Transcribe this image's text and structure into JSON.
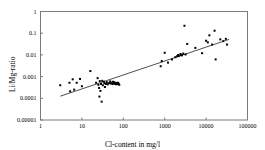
{
  "chart_data": {
    "type": "scatter",
    "title": "",
    "xlabel": "Cl-content in mg/l",
    "ylabel": "Li/Mg-ratio",
    "xscale": "log",
    "yscale": "log",
    "xlim": [
      1,
      100000
    ],
    "ylim": [
      1e-05,
      1
    ],
    "xticks": [
      1,
      10,
      100,
      1000,
      10000,
      100000
    ],
    "xtick_labels": [
      "1",
      "10",
      "100",
      "1000",
      "10000",
      "100000"
    ],
    "yticks": [
      1e-05,
      0.0001,
      0.001,
      0.01,
      0.1,
      1
    ],
    "ytick_labels": [
      "0.00001",
      "0.0001",
      "0.001",
      "0.01",
      "0.1",
      "1"
    ],
    "grid": false,
    "legend": "none",
    "marker": "square",
    "marker_color": "#000000",
    "marker_size": 2,
    "series": [
      {
        "name": "samples",
        "points": [
          [
            3.0,
            0.0004
          ],
          [
            5.0,
            0.00052
          ],
          [
            5.2,
            0.00021
          ],
          [
            6.0,
            0.00075
          ],
          [
            6.5,
            0.00025
          ],
          [
            7.5,
            0.00052
          ],
          [
            9.0,
            0.00078
          ],
          [
            10.0,
            0.00036
          ],
          [
            16.0,
            0.0018
          ],
          [
            22.0,
            0.00052
          ],
          [
            24.0,
            0.00085
          ],
          [
            25.0,
            0.00042
          ],
          [
            26.0,
            0.0003
          ],
          [
            26.5,
            0.00012
          ],
          [
            27.0,
            0.00062
          ],
          [
            28.0,
            0.00022
          ],
          [
            29.0,
            0.00046
          ],
          [
            30.0,
            7e-05
          ],
          [
            31.0,
            0.00064
          ],
          [
            32.0,
            0.0004
          ],
          [
            34.0,
            0.00058
          ],
          [
            35.0,
            0.0005
          ],
          [
            36.0,
            0.00033
          ],
          [
            38.0,
            0.00046
          ],
          [
            40.0,
            0.00055
          ],
          [
            42.0,
            0.00044
          ],
          [
            45.0,
            0.0005
          ],
          [
            48.0,
            0.0006
          ],
          [
            50.0,
            0.00048
          ],
          [
            52.0,
            0.00052
          ],
          [
            55.0,
            0.00045
          ],
          [
            56.0,
            0.00058
          ],
          [
            58.0,
            0.0005
          ],
          [
            60.0,
            0.00055
          ],
          [
            62.0,
            0.00046
          ],
          [
            64.0,
            0.00052
          ],
          [
            66.0,
            0.00048
          ],
          [
            68.0,
            0.00044
          ],
          [
            70.0,
            0.0005
          ],
          [
            72.0,
            0.00046
          ],
          [
            75.0,
            0.00052
          ],
          [
            78.0,
            0.00045
          ],
          [
            80.0,
            0.00042
          ],
          [
            800.0,
            0.003
          ],
          [
            850.0,
            0.0052
          ],
          [
            1000.0,
            0.0125
          ],
          [
            1200.0,
            0.0044
          ],
          [
            1500.0,
            0.0062
          ],
          [
            1800.0,
            0.0078
          ],
          [
            2000.0,
            0.0087
          ],
          [
            2100.0,
            0.0098
          ],
          [
            2200.0,
            0.009
          ],
          [
            2400.0,
            0.011
          ],
          [
            2500.0,
            0.01
          ],
          [
            2600.0,
            0.0095
          ],
          [
            2800.0,
            0.0115
          ],
          [
            3000.0,
            0.22
          ],
          [
            3200.0,
            0.0105
          ],
          [
            3500.0,
            0.032
          ],
          [
            5500.0,
            0.021
          ],
          [
            8000.0,
            0.012
          ],
          [
            10000.0,
            0.045
          ],
          [
            11000.0,
            0.038
          ],
          [
            12000.0,
            0.08
          ],
          [
            14000.0,
            0.03
          ],
          [
            16000.0,
            0.13
          ],
          [
            17000.0,
            0.0062
          ],
          [
            22000.0,
            0.052
          ],
          [
            26000.0,
            0.043
          ],
          [
            30000.0,
            0.055
          ],
          [
            32000.0,
            0.03
          ]
        ]
      }
    ],
    "trendline": {
      "name": "regression line",
      "x_start": 3.0,
      "y_start": 0.000125,
      "x_end": 36000.0,
      "y_end": 0.052,
      "color": "#3a3a3a"
    }
  }
}
